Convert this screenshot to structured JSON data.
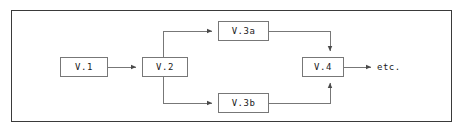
{
  "diagram": {
    "type": "flowchart",
    "orientation": "left-to-right",
    "frame": {
      "border_color": "#3a3a3a",
      "background": "#ffffff"
    },
    "line_color": "#777777",
    "text_color": "#1a1a1a",
    "nodes": [
      {
        "id": "v1",
        "label": "V.1",
        "shape": "rectangle"
      },
      {
        "id": "v2",
        "label": "V.2",
        "shape": "rectangle"
      },
      {
        "id": "v3a",
        "label": "V.3a",
        "shape": "rectangle"
      },
      {
        "id": "v3b",
        "label": "V.3b",
        "shape": "rectangle"
      },
      {
        "id": "v4",
        "label": "V.4",
        "shape": "rectangle"
      }
    ],
    "terminal_labels": [
      {
        "id": "etc",
        "label": "etc."
      }
    ],
    "edges": [
      {
        "from": "v1",
        "to": "v3a",
        "arrow": true,
        "routing": "straight-right"
      },
      {
        "from": "v2",
        "to": "v3a",
        "arrow": true,
        "routing": "up-then-right"
      },
      {
        "from": "v2",
        "to": "v3b",
        "arrow": true,
        "routing": "down-then-right"
      },
      {
        "from": "v3a",
        "to": "v4",
        "arrow": true,
        "routing": "right-then-down"
      },
      {
        "from": "v3b",
        "to": "v4",
        "arrow": true,
        "routing": "right-then-up"
      },
      {
        "from": "v4",
        "to": "etc",
        "arrow": true,
        "routing": "straight-right"
      }
    ]
  }
}
